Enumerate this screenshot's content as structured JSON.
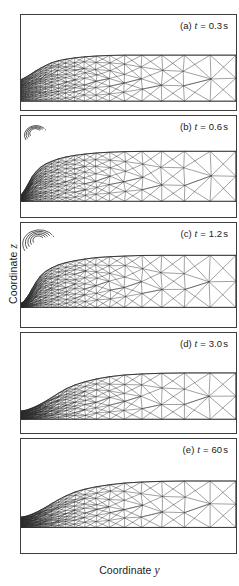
{
  "figure": {
    "axes": {
      "y_axis_label_prefix": "Coordinate ",
      "y_axis_label_var": "z",
      "x_axis_label_prefix": "Coordinate ",
      "x_axis_label_var": "y"
    },
    "panels": [
      {
        "id": "a",
        "tag": "(a)",
        "var": "t",
        "eq": " = ",
        "value": "0.3",
        "unit": "s",
        "label": "(a) t = 0.3 s"
      },
      {
        "id": "b",
        "tag": "(b)",
        "var": "t",
        "eq": " = ",
        "value": "0.6",
        "unit": "s",
        "label": "(b) t = 0.6 s"
      },
      {
        "id": "c",
        "tag": "(c)",
        "var": "t",
        "eq": " = ",
        "value": "1.2",
        "unit": "s",
        "label": "(c) t = 1.2 s"
      },
      {
        "id": "d",
        "tag": "(d)",
        "var": "t",
        "eq": " = ",
        "value": "3.0",
        "unit": "s",
        "label": "(d) t = 3.0 s"
      },
      {
        "id": "e",
        "tag": "(e)",
        "var": "t",
        "eq": " = ",
        "value": "60",
        "unit": "s",
        "label": "(e) t = 60 s"
      }
    ]
  },
  "chart_data": {
    "type": "line",
    "title": "",
    "xlabel": "Coordinate y",
    "ylabel": "Coordinate z",
    "grid": false,
    "legend": "none",
    "series": [
      {
        "name": "free-surface (a) t = 0.3 s",
        "x": [
          0,
          4,
          9,
          15,
          22,
          30,
          40,
          52,
          66,
          82,
          100,
          130,
          160,
          190,
          217
        ],
        "y": [
          22,
          24,
          27,
          31,
          35,
          39,
          42,
          44,
          45.5,
          46.5,
          47,
          47,
          47,
          47,
          47
        ]
      },
      {
        "name": "free-surface (b) t = 0.6 s",
        "x": [
          0,
          3,
          7,
          12,
          18,
          26,
          36,
          48,
          62,
          78,
          96,
          126,
          156,
          186,
          217
        ],
        "y": [
          6,
          10,
          17,
          26,
          33,
          38,
          42,
          45,
          47,
          48.5,
          49.5,
          50,
          50,
          50,
          50
        ]
      },
      {
        "name": "free-surface (c) t = 1.2 s",
        "x": [
          0,
          3,
          7,
          12,
          18,
          26,
          36,
          48,
          62,
          78,
          96,
          126,
          156,
          186,
          217
        ],
        "y": [
          4,
          6,
          11,
          20,
          30,
          37,
          42,
          45.5,
          48,
          50,
          51,
          52,
          52,
          52,
          52
        ]
      },
      {
        "name": "free-surface (d) t = 3.0 s",
        "x": [
          0,
          6,
          14,
          24,
          34,
          44,
          56,
          70,
          86,
          104,
          130,
          160,
          190,
          217
        ],
        "y": [
          8,
          9,
          12,
          17,
          23,
          29,
          34,
          38,
          41,
          43,
          44.5,
          45,
          45,
          45
        ]
      },
      {
        "name": "free-surface (e) t = 60 s",
        "x": [
          0,
          6,
          14,
          24,
          34,
          44,
          56,
          70,
          86,
          104,
          130,
          160,
          190,
          217
        ],
        "y": [
          10,
          11,
          14,
          19,
          25,
          30,
          35,
          38.5,
          41,
          43,
          44.5,
          45,
          45,
          45
        ]
      }
    ],
    "panel_values": [
      "0.3",
      "0.6",
      "1.2",
      "3.0",
      "60"
    ],
    "panel_unit": "s",
    "panel_variable": "t"
  }
}
